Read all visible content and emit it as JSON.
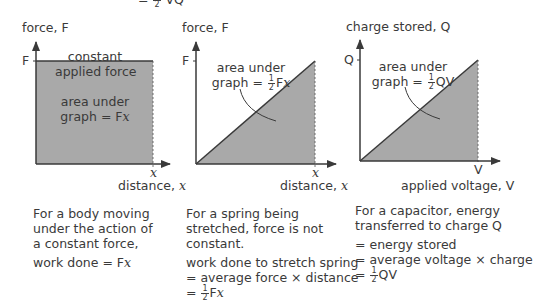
{
  "header_fragment": {
    "text": "= ½ VQ"
  },
  "graphs": [
    {
      "id": "constant-force",
      "y_axis_label": "force, F",
      "y_tick": "F",
      "x_tick": "x",
      "x_axis_label_prefix": "distance, ",
      "x_axis_label_var": "x",
      "line_label_1": "constant",
      "line_label_2": "applied force",
      "area_label_1": "area under",
      "area_label_2_prefix": "graph = F",
      "area_label_2_var": "x",
      "caption": [
        "For a body moving",
        "under the action of",
        "a constant force,"
      ],
      "result_prefix": "work done = F",
      "result_var": "x"
    },
    {
      "id": "spring",
      "y_axis_label": "force, F",
      "y_tick": "F",
      "x_tick": "x",
      "x_axis_label_prefix": "distance, ",
      "x_axis_label_var": "x",
      "area_label_1": "area under",
      "area_label_2_prefix": "graph = ",
      "area_label_frac_num": "1",
      "area_label_frac_den": "2",
      "area_label_2_suffix": "F",
      "area_label_2_var": "x",
      "caption": [
        "For a spring being",
        "stretched, force is not",
        "constant."
      ],
      "result_lines": [
        "work done to stretch spring",
        "= average force × distance"
      ],
      "result_last_prefix": "= ",
      "result_last_suffix": "F",
      "result_last_var": "x"
    },
    {
      "id": "capacitor",
      "y_axis_label": "charge stored, Q",
      "y_tick": "Q",
      "x_tick": "V",
      "x_axis_label": "applied voltage, V",
      "area_label_1": "area under",
      "area_label_2_prefix": "graph = ",
      "area_label_frac_num": "1",
      "area_label_frac_den": "2",
      "area_label_2_suffix": "QV",
      "caption": [
        "For a capacitor, energy",
        "transferred to charge Q"
      ],
      "result_lines": [
        "= energy stored",
        "= average voltage × charge"
      ],
      "result_last_prefix": "= ",
      "result_last_suffix": "QV"
    }
  ],
  "colors": {
    "fill": "#a9a9a9",
    "axis": "#3a3a3a",
    "text": "#3a3a3a"
  }
}
